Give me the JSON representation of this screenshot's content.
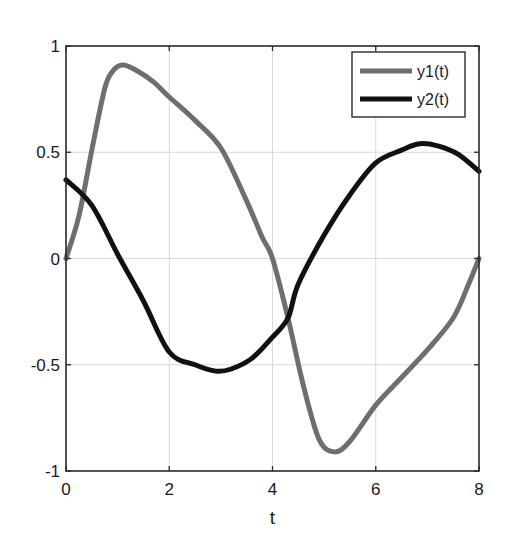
{
  "chart_data": {
    "type": "line",
    "title": "",
    "xlabel": "t",
    "ylabel": "",
    "xlim": [
      0,
      8
    ],
    "ylim": [
      -1,
      1
    ],
    "xticks": [
      0,
      2,
      4,
      6,
      8
    ],
    "xtick_labels": [
      "0",
      "2",
      "4",
      "6",
      "8"
    ],
    "yticks": [
      -1,
      -0.5,
      0,
      0.5,
      1
    ],
    "ytick_labels": [
      "-1",
      "-0.5",
      "0",
      "0.5",
      "1"
    ],
    "grid": true,
    "legend": {
      "position": "top-right",
      "entries": [
        "y1(t)",
        "y2(t)"
      ]
    },
    "series": [
      {
        "name": "y1(t)",
        "color": "#6e6e6e",
        "x": [
          0,
          0.25,
          0.5,
          0.75,
          0.9,
          1.1,
          1.4,
          1.7,
          2.0,
          2.5,
          3.0,
          3.5,
          3.8,
          4.0,
          4.3,
          4.6,
          4.9,
          5.2,
          5.5,
          6.0,
          6.5,
          7.0,
          7.5,
          7.8,
          8.0
        ],
        "y": [
          0,
          0.2,
          0.51,
          0.8,
          0.88,
          0.91,
          0.88,
          0.83,
          0.76,
          0.65,
          0.52,
          0.27,
          0.1,
          0.0,
          -0.28,
          -0.6,
          -0.85,
          -0.91,
          -0.86,
          -0.69,
          -0.56,
          -0.43,
          -0.28,
          -0.12,
          0.0
        ]
      },
      {
        "name": "y2(t)",
        "color": "#111111",
        "x": [
          0,
          0.5,
          1.0,
          1.5,
          2.0,
          2.5,
          2.9,
          3.2,
          3.6,
          4.0,
          4.3,
          4.5,
          5.0,
          5.5,
          6.0,
          6.5,
          6.85,
          7.2,
          7.6,
          8.0
        ],
        "y": [
          0.37,
          0.25,
          0.02,
          -0.2,
          -0.44,
          -0.5,
          -0.53,
          -0.52,
          -0.47,
          -0.37,
          -0.28,
          -0.12,
          0.11,
          0.3,
          0.45,
          0.51,
          0.54,
          0.53,
          0.49,
          0.41
        ]
      }
    ]
  }
}
